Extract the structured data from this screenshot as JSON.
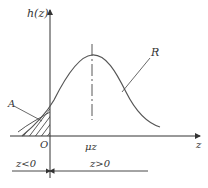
{
  "diagram": {
    "type": "distribution-curve",
    "y_axis_label": "h(z)",
    "x_axis_label": "z",
    "origin_label": "O",
    "mean_label": "μz",
    "curve_label": "R",
    "area_label": "A",
    "region_left_label": "z<0",
    "region_right_label": "z>0",
    "colors": {
      "line": "#333333",
      "curve": "#555555"
    }
  }
}
